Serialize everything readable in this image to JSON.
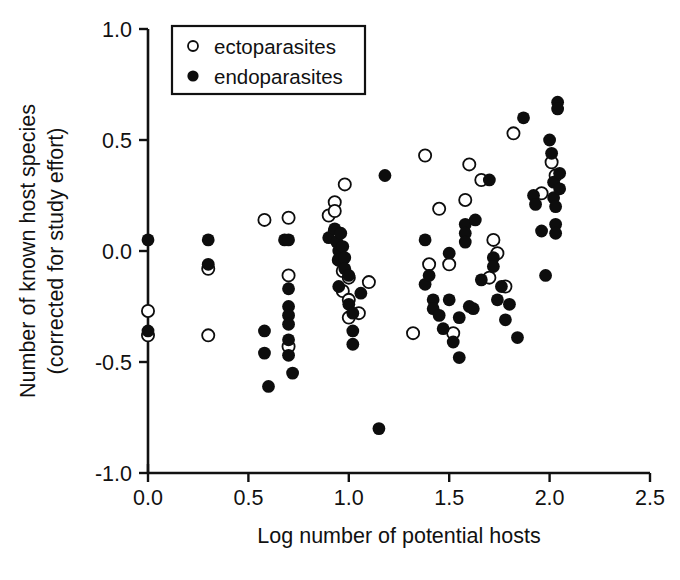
{
  "chart_data": {
    "type": "scatter",
    "title": "",
    "xlabel": "Log number of potential hosts",
    "ylabel": "Number of known host species (corrected for study effort)",
    "ylabel_line1": "Number of known host species",
    "ylabel_line2": "(corrected for study effort)",
    "xlim": [
      0.0,
      2.5
    ],
    "ylim": [
      -1.0,
      1.0
    ],
    "xticks": [
      0.0,
      0.5,
      1.0,
      1.5,
      2.0,
      2.5
    ],
    "xtick_labels": [
      "0.0",
      "0.5",
      "1.0",
      "1.5",
      "2.0",
      "2.5"
    ],
    "yticks": [
      -1.0,
      -0.5,
      0.0,
      0.5,
      1.0
    ],
    "ytick_labels": [
      "-1.0",
      "-0.5",
      "0.0",
      "0.5",
      "1.0"
    ],
    "grid": false,
    "legend_position": "upper left",
    "legend": [
      {
        "label": "ectoparasites",
        "marker": "open-circle",
        "color": "#ffffff",
        "edge": "#0d0d0d"
      },
      {
        "label": "endoparasites",
        "marker": "filled-circle",
        "color": "#0d0d0d",
        "edge": "#0d0d0d"
      }
    ],
    "series": [
      {
        "name": "ectoparasites",
        "marker": "open-circle",
        "points": [
          [
            0.0,
            -0.27
          ],
          [
            0.0,
            -0.38
          ],
          [
            0.3,
            -0.08
          ],
          [
            0.3,
            -0.38
          ],
          [
            0.58,
            0.14
          ],
          [
            0.7,
            0.15
          ],
          [
            0.7,
            -0.11
          ],
          [
            0.7,
            -0.43
          ],
          [
            0.9,
            0.16
          ],
          [
            0.93,
            0.22
          ],
          [
            0.93,
            0.18
          ],
          [
            0.93,
            0.09
          ],
          [
            0.95,
            -0.04
          ],
          [
            0.97,
            -0.09
          ],
          [
            0.97,
            -0.18
          ],
          [
            0.98,
            0.3
          ],
          [
            1.0,
            -0.12
          ],
          [
            1.0,
            -0.22
          ],
          [
            1.0,
            -0.3
          ],
          [
            1.05,
            -0.28
          ],
          [
            1.1,
            -0.14
          ],
          [
            1.32,
            -0.37
          ],
          [
            1.38,
            0.43
          ],
          [
            1.4,
            -0.06
          ],
          [
            1.45,
            0.19
          ],
          [
            1.5,
            -0.06
          ],
          [
            1.52,
            -0.37
          ],
          [
            1.58,
            0.23
          ],
          [
            1.6,
            0.39
          ],
          [
            1.66,
            0.32
          ],
          [
            1.7,
            -0.12
          ],
          [
            1.72,
            0.05
          ],
          [
            1.74,
            -0.01
          ],
          [
            1.78,
            -0.16
          ],
          [
            1.82,
            0.53
          ],
          [
            1.96,
            0.26
          ],
          [
            2.01,
            0.4
          ],
          [
            2.03,
            0.34
          ]
        ]
      },
      {
        "name": "endoparasites",
        "marker": "filled-circle",
        "points": [
          [
            0.0,
            0.05
          ],
          [
            0.0,
            -0.36
          ],
          [
            0.3,
            0.05
          ],
          [
            0.3,
            -0.06
          ],
          [
            0.58,
            -0.36
          ],
          [
            0.58,
            -0.46
          ],
          [
            0.6,
            -0.61
          ],
          [
            0.68,
            0.05
          ],
          [
            0.7,
            0.05
          ],
          [
            0.7,
            -0.17
          ],
          [
            0.7,
            -0.25
          ],
          [
            0.7,
            -0.29
          ],
          [
            0.7,
            -0.33
          ],
          [
            0.7,
            -0.4
          ],
          [
            0.7,
            -0.47
          ],
          [
            0.72,
            -0.55
          ],
          [
            0.9,
            0.06
          ],
          [
            0.93,
            0.1
          ],
          [
            0.94,
            0.04
          ],
          [
            0.95,
            0.0
          ],
          [
            0.95,
            -0.04
          ],
          [
            0.96,
            0.08
          ],
          [
            0.97,
            0.02
          ],
          [
            0.98,
            -0.03
          ],
          [
            0.98,
            -0.08
          ],
          [
            0.95,
            -0.16
          ],
          [
            1.0,
            -0.11
          ],
          [
            1.0,
            -0.24
          ],
          [
            1.02,
            -0.28
          ],
          [
            1.02,
            -0.36
          ],
          [
            1.02,
            -0.42
          ],
          [
            1.06,
            -0.19
          ],
          [
            1.15,
            -0.8
          ],
          [
            1.18,
            0.34
          ],
          [
            1.38,
            0.05
          ],
          [
            1.38,
            -0.15
          ],
          [
            1.4,
            -0.11
          ],
          [
            1.42,
            -0.22
          ],
          [
            1.42,
            -0.26
          ],
          [
            1.45,
            -0.29
          ],
          [
            1.47,
            -0.35
          ],
          [
            1.5,
            -0.01
          ],
          [
            1.5,
            -0.22
          ],
          [
            1.52,
            -0.41
          ],
          [
            1.55,
            -0.3
          ],
          [
            1.55,
            -0.48
          ],
          [
            1.58,
            0.12
          ],
          [
            1.58,
            0.08
          ],
          [
            1.58,
            0.04
          ],
          [
            1.6,
            -0.25
          ],
          [
            1.62,
            -0.26
          ],
          [
            1.63,
            0.14
          ],
          [
            1.66,
            -0.13
          ],
          [
            1.7,
            0.32
          ],
          [
            1.72,
            -0.03
          ],
          [
            1.72,
            -0.07
          ],
          [
            1.74,
            -0.22
          ],
          [
            1.76,
            -0.16
          ],
          [
            1.78,
            -0.31
          ],
          [
            1.8,
            -0.24
          ],
          [
            1.84,
            -0.39
          ],
          [
            1.87,
            0.6
          ],
          [
            1.92,
            0.25
          ],
          [
            1.93,
            0.21
          ],
          [
            1.96,
            0.09
          ],
          [
            1.98,
            -0.11
          ],
          [
            2.0,
            0.5
          ],
          [
            2.01,
            0.44
          ],
          [
            2.02,
            0.31
          ],
          [
            2.02,
            0.24
          ],
          [
            2.03,
            0.2
          ],
          [
            2.03,
            0.12
          ],
          [
            2.03,
            0.08
          ],
          [
            2.04,
            0.67
          ],
          [
            2.04,
            0.64
          ],
          [
            2.05,
            0.35
          ],
          [
            2.05,
            0.28
          ]
        ]
      }
    ]
  }
}
